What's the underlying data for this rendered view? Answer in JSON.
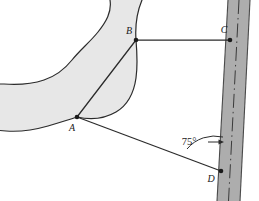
{
  "figure": {
    "colors": {
      "background": "#ffffff",
      "swamp_fill": "#e7e7e7",
      "swamp_outline": "#2b2b2b",
      "road_fill": "#adadad",
      "road_edge": "#4a4a4a",
      "road_centerline": "#3a3a3a",
      "line_stroke": "#2b2b2b",
      "label_color": "#1a1a1a"
    },
    "points": [
      {
        "id": "A",
        "label": "A",
        "x": 77,
        "y": 117,
        "label_x": 72,
        "label_y": 131,
        "marker": "dot"
      },
      {
        "id": "B",
        "label": "B",
        "x": 136,
        "y": 40,
        "label_x": 129,
        "label_y": 34,
        "marker": "dot"
      },
      {
        "id": "C",
        "label": "C",
        "x": 230,
        "y": 40,
        "label_x": 224,
        "label_y": 33,
        "marker": "dot"
      },
      {
        "id": "D",
        "label": "D",
        "x": 221,
        "y": 171,
        "label_x": 211,
        "label_y": 182,
        "marker": "dot"
      }
    ],
    "segments": [
      {
        "id": "AB",
        "from": "A",
        "to": "B",
        "description": "baseline across swamp"
      },
      {
        "id": "BC",
        "from": "B",
        "to": "C",
        "description": "horizontal sight line to road"
      },
      {
        "id": "AD",
        "from": "A",
        "to": "D",
        "description": "sight line to road"
      }
    ],
    "angle_annotations": [
      {
        "id": "angle-at-D",
        "value": "75",
        "unit": "°",
        "text": "75°",
        "at_point": "D",
        "between": [
          "AD",
          "road"
        ],
        "label_x": 189,
        "label_y": 145
      }
    ],
    "road": {
      "id": "road",
      "orientation": "near-vertical, tilted",
      "has_centerline": true,
      "centerline_style": "dash-dot",
      "top_left_x": 228,
      "top_right_x": 250,
      "bottom_left_x": 217,
      "bottom_right_x": 240
    },
    "swamp": {
      "id": "swamp-region",
      "description": "irregular shaded area extending off the left and top edges"
    }
  }
}
